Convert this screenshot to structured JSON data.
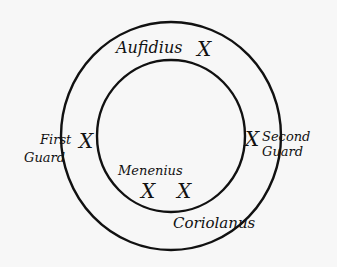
{
  "diagram": {
    "colors": {
      "background": "#f7f7f7",
      "ink": "#111111"
    },
    "circles": [
      {
        "name": "outer",
        "cx": 171,
        "cy": 136,
        "rx": 110,
        "ry": 114
      },
      {
        "name": "inner",
        "cx": 171,
        "cy": 136,
        "rx": 74,
        "ry": 76
      }
    ],
    "marker_glyph": "X",
    "characters": [
      {
        "name": "Aufidius",
        "label_x": 118,
        "label_y": 52,
        "marks": [
          {
            "x": 207,
            "y": 48
          }
        ]
      },
      {
        "name": "First",
        "name2": "Guard",
        "label_x": 40,
        "label_y": 142,
        "marks": [
          {
            "x": 88,
            "y": 139
          }
        ]
      },
      {
        "name": "Second",
        "name2": "Guard",
        "label_x": 258,
        "label_y": 139,
        "marks": [
          {
            "x": 254,
            "y": 137
          }
        ]
      },
      {
        "name": "Menenius",
        "label_x": 118,
        "label_y": 174,
        "marks": [
          {
            "x": 150,
            "y": 190
          }
        ]
      },
      {
        "name": "Coriolanus",
        "label_x": 175,
        "label_y": 230,
        "marks": [
          {
            "x": 186,
            "y": 190
          }
        ]
      }
    ]
  }
}
